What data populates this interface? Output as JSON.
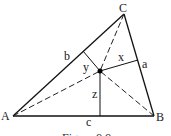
{
  "diagram": {
    "vertices": {
      "A": {
        "label": "A",
        "x": 13,
        "y": 116
      },
      "B": {
        "label": "B",
        "x": 154,
        "y": 116
      },
      "C": {
        "label": "C",
        "x": 124,
        "y": 14
      }
    },
    "interior_point": {
      "x": 100,
      "y": 71
    },
    "side_labels": {
      "a": "a",
      "b": "b",
      "c": "c"
    },
    "distance_labels": {
      "x": "x",
      "y": "y",
      "z": "z"
    },
    "caption": "Figure 9.9"
  }
}
